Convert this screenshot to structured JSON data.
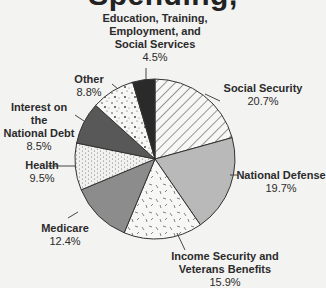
{
  "title_partial": "Spending,",
  "chart_data": {
    "type": "pie",
    "start_angle": "12 o'clock",
    "direction": "clockwise",
    "slices": [
      {
        "label": "Social Security",
        "value": 20.7,
        "pct_text": "20.7%",
        "fill": "hatch-diagonal"
      },
      {
        "label": "National Defense",
        "value": 19.7,
        "pct_text": "19.7%",
        "fill": "#b9b9b9"
      },
      {
        "label": "Income Security and Veterans Benefits",
        "value": 15.9,
        "pct_text": "15.9%",
        "fill": "dashes-light"
      },
      {
        "label": "Medicare",
        "value": 12.4,
        "pct_text": "12.4%",
        "fill": "#8c8c8c"
      },
      {
        "label": "Health",
        "value": 9.5,
        "pct_text": "9.5%",
        "fill": "dotted-waves"
      },
      {
        "label": "Interest on the National Debt",
        "value": 8.5,
        "pct_text": "8.5%",
        "fill": "#585858"
      },
      {
        "label": "Other",
        "value": 8.8,
        "pct_text": "8.8%",
        "fill": "speckled"
      },
      {
        "label": "Education, Training, Employment, and Social Services",
        "value": 4.5,
        "pct_text": "4.5%",
        "fill": "#2a2a2a"
      }
    ]
  },
  "labels": {
    "education": {
      "lines": [
        "Education, Training,",
        "Employment, and",
        "Social Services"
      ],
      "pct": "4.5%"
    },
    "other": {
      "name": "Other",
      "pct": "8.8%"
    },
    "interest": {
      "lines": [
        "Interest on the",
        "National Debt"
      ],
      "pct": "8.5%"
    },
    "health": {
      "name": "Health",
      "pct": "9.5%"
    },
    "medicare": {
      "name": "Medicare",
      "pct": "12.4%"
    },
    "social_security": {
      "name": "Social Security",
      "pct": "20.7%"
    },
    "national_defense": {
      "name": "National Defense",
      "pct": "19.7%"
    },
    "income_security": {
      "lines": [
        "Income Security and",
        "Veterans Benefits"
      ],
      "pct": "15.9%"
    }
  }
}
